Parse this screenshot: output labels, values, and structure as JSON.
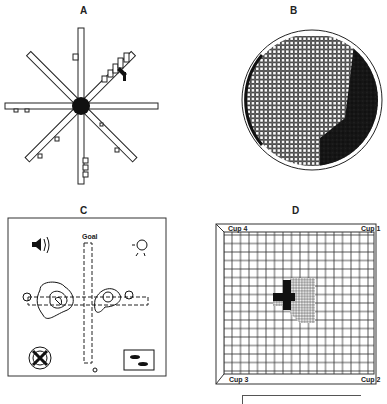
{
  "panels": {
    "a": {
      "label": "A",
      "type": "radial-arm-maze",
      "arms": 8
    },
    "b": {
      "label": "B",
      "type": "circular-grid-map"
    },
    "c": {
      "label": "C",
      "type": "plus-maze-contour",
      "goal_label": "Goal",
      "cues": [
        "speaker-icon",
        "light-icon",
        "fan-icon",
        "rats-picture-icon"
      ]
    },
    "d": {
      "label": "D",
      "type": "grid-arena",
      "corners": {
        "top_left": "Cup 4",
        "top_right": "Cup 1",
        "bottom_left": "Cup 3",
        "bottom_right": "Cup 2"
      }
    }
  },
  "colors": {
    "ink": "#111111",
    "background": "#ffffff"
  }
}
